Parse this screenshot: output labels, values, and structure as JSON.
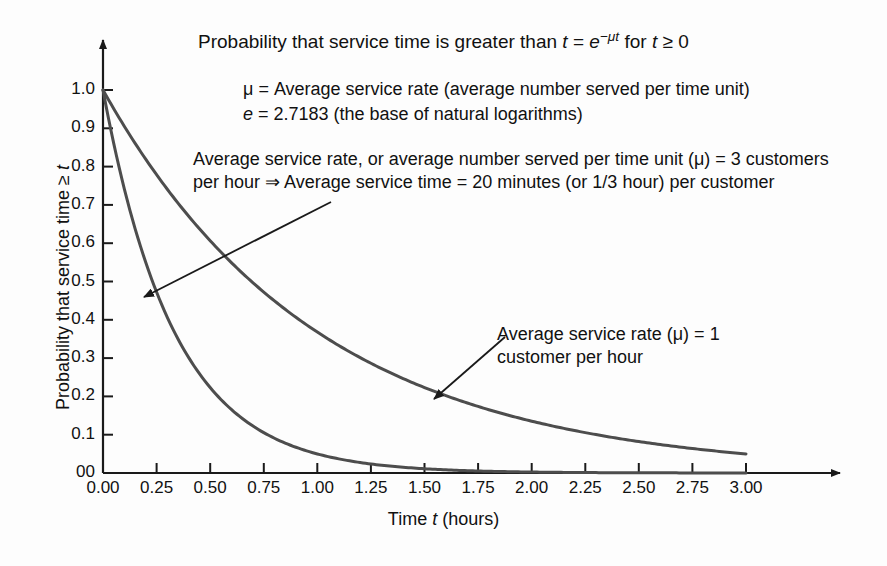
{
  "chart_data": {
    "type": "line",
    "title": "Probability that service time is greater than t = e−μt for t ≥ 0",
    "title_parts": {
      "lead": "Probability that service time is greater than ",
      "var_t": "t",
      "eq": " = ",
      "base_e": "e",
      "exponent": "−μt",
      "tail_for": " for ",
      "var_t2": "t",
      "tail_cmp": " ≥ 0"
    },
    "xlabel": "Time t (hours)",
    "xlabel_parts": {
      "lead": "Time ",
      "var": "t",
      "tail": " (hours)"
    },
    "ylabel": "Probability that service time ≥ t",
    "ylabel_parts": {
      "lead": "Probability that service time ≥ ",
      "var": "t"
    },
    "xlim": [
      0,
      3
    ],
    "ylim": [
      0,
      1
    ],
    "grid": false,
    "legend_position": "inline-annotations",
    "xticks": [
      "0.00",
      "0.25",
      "0.50",
      "0.75",
      "1.00",
      "1.25",
      "1.50",
      "1.75",
      "2.00",
      "2.25",
      "2.50",
      "2.75",
      "3.00"
    ],
    "xtick_values": [
      0,
      0.25,
      0.5,
      0.75,
      1.0,
      1.25,
      1.5,
      1.75,
      2.0,
      2.25,
      2.5,
      2.75,
      3.0
    ],
    "yticks": [
      "00",
      "0.1",
      "0.2",
      "0.3",
      "0.4",
      "0.5",
      "0.6",
      "0.7",
      "0.8",
      "0.9",
      "1.0"
    ],
    "ytick_values": [
      0,
      0.1,
      0.2,
      0.3,
      0.4,
      0.5,
      0.6,
      0.7,
      0.8,
      0.9,
      1.0
    ],
    "x": [
      0,
      0.25,
      0.5,
      0.75,
      1.0,
      1.25,
      1.5,
      1.75,
      2.0,
      2.25,
      2.5,
      2.75,
      3.0
    ],
    "series": [
      {
        "name": "Average service rate (μ) = 3 customers per hour",
        "mu": 3,
        "color": "#4d4d4d",
        "values": [
          1.0,
          0.472,
          0.223,
          0.105,
          0.05,
          0.024,
          0.011,
          0.005,
          0.0025,
          0.0012,
          0.0006,
          0.0003,
          0.0001
        ]
      },
      {
        "name": "Average service rate (μ) = 1 customer per hour",
        "mu": 1,
        "color": "#4d4d4d",
        "values": [
          1.0,
          0.779,
          0.607,
          0.472,
          0.368,
          0.287,
          0.223,
          0.174,
          0.135,
          0.105,
          0.082,
          0.064,
          0.05
        ]
      }
    ],
    "annotations": [
      {
        "id": "mu3",
        "text": "Average service rate, or average number served per time unit (μ) = 3 customers per hour ⇒ Average service time = 20 minutes (or 1/3 hour) per customer",
        "points_to": {
          "t": 0.18,
          "p": 0.59
        }
      },
      {
        "id": "mu1",
        "text": "Average service rate (μ) = 1 customer per hour",
        "points_to": {
          "t": 1.6,
          "p": 0.21
        }
      }
    ],
    "definitions": [
      "μ = Average service rate (average number served per time unit)",
      "e = 2.7183 (the base of natural logarithms)"
    ],
    "definition_parts": [
      {
        "symbol": "μ",
        "rest": " = Average service rate (average number served per time unit)"
      },
      {
        "symbol": "e",
        "rest": " = 2.7183 (the base of natural logarithms)"
      }
    ]
  },
  "colors": {
    "curve": "#4d4d4d",
    "axis": "#1a1a1a",
    "text": "#111111",
    "background": "#fdfdfd"
  }
}
